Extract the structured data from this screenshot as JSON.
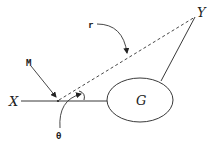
{
  "diagram": {
    "labels": {
      "x": "X",
      "y": "Y",
      "g": "G",
      "m": "M",
      "r": "r",
      "theta": "θ"
    },
    "colors": {
      "stroke": "#222222",
      "background": "#ffffff"
    },
    "elements": [
      {
        "name": "baseline",
        "from": "X",
        "to": "G",
        "style": "solid"
      },
      {
        "name": "radius-line",
        "from": "M",
        "to": "Y",
        "style": "dashed",
        "label": "r"
      },
      {
        "name": "connector",
        "from": "G",
        "to": "Y",
        "style": "solid"
      },
      {
        "name": "ellipse",
        "label": "G"
      },
      {
        "name": "angle-arc",
        "at": "M",
        "label": "θ"
      }
    ]
  }
}
